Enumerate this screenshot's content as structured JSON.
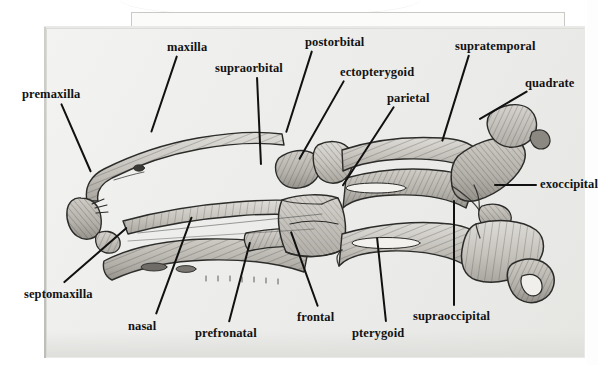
{
  "figure": {
    "kind": "anatomical-line-drawing",
    "background_color": "#efefed",
    "ink_color": "#111111",
    "page_color": "#efefed"
  },
  "labels": [
    {
      "id": "premaxilla",
      "text": "premaxilla",
      "x": 22,
      "y": 88,
      "leader": {
        "x1": 62,
        "y1": 103,
        "x2": 92,
        "y2": 172
      }
    },
    {
      "id": "maxilla",
      "text": "maxilla",
      "x": 167,
      "y": 41,
      "leader": {
        "x1": 178,
        "y1": 56,
        "x2": 152,
        "y2": 133
      }
    },
    {
      "id": "supraorbital",
      "text": "supraorbital",
      "x": 215,
      "y": 62,
      "leader": {
        "x1": 258,
        "y1": 77,
        "x2": 262,
        "y2": 165
      }
    },
    {
      "id": "postorbital",
      "text": "postorbital",
      "x": 305,
      "y": 36,
      "leader": {
        "x1": 313,
        "y1": 51,
        "x2": 287,
        "y2": 133
      }
    },
    {
      "id": "ectopterygoid",
      "text": "ectopterygoid",
      "x": 340,
      "y": 66,
      "leader": {
        "x1": 345,
        "y1": 81,
        "x2": 300,
        "y2": 160
      }
    },
    {
      "id": "parietal",
      "text": "parietal",
      "x": 387,
      "y": 92,
      "leader": {
        "x1": 395,
        "y1": 107,
        "x2": 343,
        "y2": 187
      }
    },
    {
      "id": "supratemporal",
      "text": "supratemporal",
      "x": 455,
      "y": 40,
      "leader": {
        "x1": 470,
        "y1": 55,
        "x2": 443,
        "y2": 142
      }
    },
    {
      "id": "quadrate",
      "text": "quadrate",
      "x": 525,
      "y": 77,
      "leader": {
        "x1": 528,
        "y1": 92,
        "x2": 480,
        "y2": 120
      }
    },
    {
      "id": "exoccipital",
      "text": "exoccipital",
      "x": 540,
      "y": 178,
      "leader": {
        "x1": 537,
        "y1": 186,
        "x2": 494,
        "y2": 186
      }
    },
    {
      "id": "supraoccipital",
      "text": "supraoccipital",
      "x": 413,
      "y": 310,
      "leader": {
        "x1": 453,
        "y1": 306,
        "x2": 453,
        "y2": 200
      }
    },
    {
      "id": "pterygoid",
      "text": "pterygoid",
      "x": 352,
      "y": 327,
      "leader": {
        "x1": 385,
        "y1": 322,
        "x2": 376,
        "y2": 237
      }
    },
    {
      "id": "frontal",
      "text": "frontal",
      "x": 297,
      "y": 311,
      "leader": {
        "x1": 317,
        "y1": 307,
        "x2": 290,
        "y2": 232
      }
    },
    {
      "id": "prefronatal",
      "text": "prefronatal",
      "x": 195,
      "y": 327,
      "leader": {
        "x1": 228,
        "y1": 322,
        "x2": 249,
        "y2": 242
      }
    },
    {
      "id": "nasal",
      "text": "nasal",
      "x": 128,
      "y": 320,
      "leader": {
        "x1": 155,
        "y1": 314,
        "x2": 191,
        "y2": 216
      }
    },
    {
      "id": "septomaxilla",
      "text": "septomaxilla",
      "x": 24,
      "y": 288,
      "leader": {
        "x1": 63,
        "y1": 282,
        "x2": 126,
        "y2": 227
      }
    }
  ],
  "colors": {
    "bone_light": "#d8d6d1",
    "bone_mid": "#bdbab4",
    "bone_dark": "#8e8b85",
    "outline": "#2a2a28",
    "hatch": "#4a4844"
  }
}
